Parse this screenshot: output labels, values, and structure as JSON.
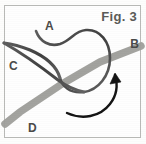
{
  "figure": {
    "caption": "Fig. 3",
    "background_color": "#fefefe",
    "frame_color": "#b9bab7",
    "labels": [
      {
        "id": "A",
        "text": "A",
        "meaning": "free-end-of-cord"
      },
      {
        "id": "B",
        "text": "B",
        "meaning": "band-right-end"
      },
      {
        "id": "C",
        "text": "C",
        "meaning": "band-left-end"
      },
      {
        "id": "D",
        "text": "D",
        "meaning": "band-bottom-end"
      }
    ],
    "elements": {
      "band": {
        "name": "gray-diagonal-band",
        "color": "#a9a9a5",
        "width_px": 7,
        "from": "C",
        "to": "B",
        "tail_to": "D"
      },
      "cord": {
        "name": "dark-cord-loop",
        "color": "#4b4b4b",
        "width_px": 3,
        "free_end": "A"
      },
      "arrow": {
        "name": "direction-arrow",
        "color": "#1a1a1a",
        "direction": "counter-clockwise-upward"
      }
    }
  }
}
